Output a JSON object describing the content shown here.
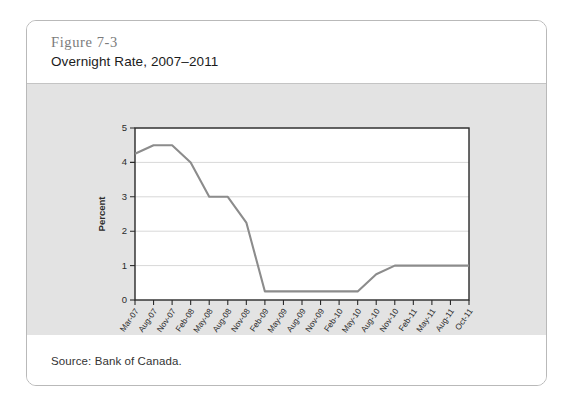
{
  "figure": {
    "number": "Figure 7-3",
    "title": "Overnight Rate, 2007–2011",
    "source": "Source: Bank of Canada."
  },
  "colors": {
    "line": "#8c8c8c",
    "panel_background": "#e3e3e3",
    "plot_background": "#ffffff",
    "axis": "#2a2a2a",
    "grid": "#d8d8d8",
    "card_border": "#b9b9b9",
    "figure_number_text": "#7b7b7b",
    "title_text": "#1b1b1b"
  },
  "chart_data": {
    "type": "line",
    "title": "Overnight Rate, 2007–2011",
    "xlabel": "Year/Month",
    "ylabel": "Percent",
    "ylim": [
      0,
      5
    ],
    "yticks": [
      0,
      1,
      2,
      3,
      4,
      5
    ],
    "ytick_labels": [
      "0",
      "1",
      "2",
      "3",
      "4",
      "5"
    ],
    "grid": true,
    "legend": "none",
    "categories": [
      "Mar-07",
      "Aug-07",
      "Nov-07",
      "Feb-08",
      "May-08",
      "Aug-08",
      "Nov-08",
      "Feb-09",
      "May-09",
      "Aug-09",
      "Nov-09",
      "Feb-10",
      "May-10",
      "Aug-10",
      "Nov-10",
      "Feb-11",
      "May-11",
      "Aug-11",
      "Oct-11"
    ],
    "series": [
      {
        "name": "Overnight Rate",
        "values": [
          4.25,
          4.5,
          4.5,
          4.0,
          3.0,
          3.0,
          2.25,
          0.25,
          0.25,
          0.25,
          0.25,
          0.25,
          0.25,
          0.75,
          1.0,
          1.0,
          1.0,
          1.0,
          1.0
        ]
      }
    ]
  }
}
